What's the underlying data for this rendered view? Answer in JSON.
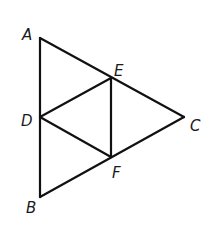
{
  "figure": {
    "type": "geometry",
    "stroke_color": "#111111",
    "background": "#ffffff"
  },
  "points": {
    "A": {
      "label": "A",
      "x": 40,
      "y": 38,
      "lx": 22,
      "ly": 40
    },
    "B": {
      "label": "B",
      "x": 40,
      "y": 197,
      "lx": 26,
      "ly": 213
    },
    "C": {
      "label": "C",
      "x": 184,
      "y": 117,
      "lx": 190,
      "ly": 131
    },
    "D": {
      "label": "D",
      "x": 40,
      "y": 117,
      "lx": 21,
      "ly": 126
    },
    "E": {
      "label": "E",
      "x": 111,
      "y": 78,
      "lx": 114,
      "ly": 76
    },
    "F": {
      "label": "F",
      "x": 111,
      "y": 157,
      "lx": 112,
      "ly": 178
    }
  },
  "segments": [
    [
      "A",
      "B"
    ],
    [
      "A",
      "C"
    ],
    [
      "B",
      "C"
    ],
    [
      "D",
      "E"
    ],
    [
      "D",
      "F"
    ],
    [
      "E",
      "F"
    ]
  ]
}
